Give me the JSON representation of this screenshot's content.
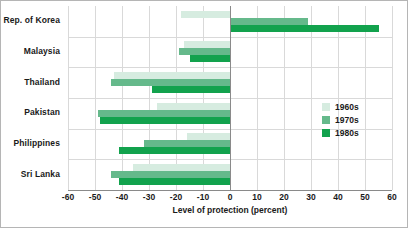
{
  "chart_data": {
    "type": "bar",
    "orientation": "horizontal",
    "title": "",
    "xlabel": "Level of protection (percent)",
    "ylabel": "",
    "xlim": [
      -60,
      60
    ],
    "xticks": [
      -60,
      -50,
      -40,
      -30,
      -20,
      -10,
      0,
      10,
      20,
      30,
      40,
      50,
      60
    ],
    "xtick_labels": [
      "-60",
      "-50",
      "-40",
      "-30",
      "-20",
      "-10",
      "0",
      "10",
      "20",
      "30",
      "40",
      "50",
      "60"
    ],
    "grid": true,
    "legend_position": "center-right",
    "categories": [
      "Rep. of Korea",
      "Malaysia",
      "Thailand",
      "Pakistan",
      "Philippines",
      "Sri Lanka"
    ],
    "series": [
      {
        "name": "1960s",
        "color": "#d6ece0",
        "values": [
          -18,
          -17,
          -43,
          -27,
          -16,
          -36
        ]
      },
      {
        "name": "1970s",
        "color": "#65b98b",
        "values": [
          29,
          -19,
          -44,
          -49,
          -32,
          -44
        ]
      },
      {
        "name": "1980s",
        "color": "#12a24d",
        "values": [
          55,
          -15,
          -29,
          -48,
          -41,
          -41
        ]
      }
    ]
  },
  "legend": {
    "items": [
      {
        "label": "1960s",
        "color": "#d6ece0"
      },
      {
        "label": "1970s",
        "color": "#65b98b"
      },
      {
        "label": "1980s",
        "color": "#12a24d"
      }
    ]
  }
}
